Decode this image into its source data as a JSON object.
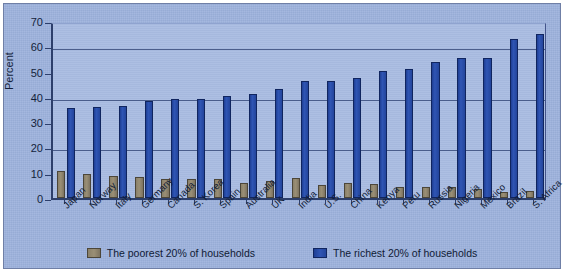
{
  "chart_data": {
    "type": "bar",
    "title": "",
    "xlabel": "",
    "ylabel": "Percent",
    "ylim": [
      0,
      70
    ],
    "ytick_step": 10,
    "yticks": [
      0,
      10,
      20,
      30,
      40,
      50,
      60,
      70
    ],
    "gridlines": [
      20,
      40,
      60
    ],
    "grid": true,
    "legend_position": "bottom",
    "categories": [
      "Japan",
      "Norway",
      "Italy",
      "Germany",
      "Canada",
      "S. Korea",
      "Spain",
      "Australia",
      "UK",
      "India",
      "U.S.",
      "China",
      "Kenya",
      "Peru",
      "Russia",
      "Nigeria",
      "Mexico",
      "Brazil",
      "S. Africa"
    ],
    "series": [
      {
        "name": "The poorest 20% of households",
        "color": "#8a8069",
        "values": [
          10.8,
          9.4,
          8.6,
          8.5,
          7.5,
          7.4,
          7.5,
          5.9,
          6.6,
          8.1,
          5.2,
          5.9,
          5.6,
          4.4,
          4.4,
          4.4,
          3.6,
          2.5,
          2.9
        ]
      },
      {
        "name": "The richest 20% of households",
        "color": "#2f55b4",
        "values": [
          35.7,
          35.8,
          36.3,
          38.5,
          39.3,
          39.3,
          40.3,
          41.3,
          43.2,
          46.1,
          46.4,
          47.5,
          50.2,
          51.2,
          53.7,
          55.2,
          55.3,
          63.0,
          64.8
        ]
      }
    ]
  },
  "legend": {
    "items": [
      {
        "label": "The poorest 20% of households",
        "swatch": "poor"
      },
      {
        "label": "The richest 20% of households",
        "swatch": "rich"
      }
    ]
  },
  "axis": {
    "y_title": "Percent"
  }
}
